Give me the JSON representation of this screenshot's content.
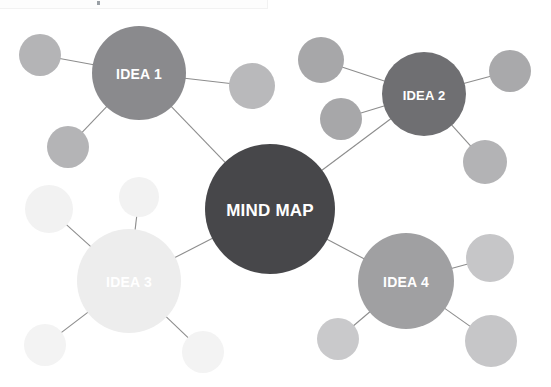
{
  "canvas": {
    "width": 551,
    "height": 387,
    "background": "#ffffff"
  },
  "top_strip": {
    "label": "toolbar-strip",
    "width": 268,
    "height": 9,
    "fill": "#fdfdfd",
    "border": "#f2f2f2",
    "dot_color": "#9aa0a6"
  },
  "diagram": {
    "title": "MIND MAP",
    "type": "mind-map",
    "link_color": "#8d8d8d",
    "link_width": 1.1,
    "main_nodes": [
      {
        "id": "center",
        "label": "MIND MAP",
        "cx": 270,
        "cy": 209,
        "r": 65,
        "fill": "#47474a",
        "text_fill": "#ffffff",
        "font_size": 17
      },
      {
        "id": "idea1",
        "label": "IDEA 1",
        "cx": 139,
        "cy": 73,
        "r": 47,
        "fill": "#8a8a8d",
        "text_fill": "#ffffff",
        "font_size": 14
      },
      {
        "id": "idea2",
        "label": "IDEA 2",
        "cx": 424,
        "cy": 94,
        "r": 42,
        "fill": "#6f6f72",
        "text_fill": "#ffffff",
        "font_size": 13
      },
      {
        "id": "idea3",
        "label": "IDEA 3",
        "cx": 129,
        "cy": 281,
        "r": 52,
        "fill": "#ededed",
        "text_fill": "#ffffff",
        "font_size": 14
      },
      {
        "id": "idea4",
        "label": "IDEA 4",
        "cx": 406,
        "cy": 281,
        "r": 48,
        "fill": "#a0a0a2",
        "text_fill": "#ffffff",
        "font_size": 14
      }
    ],
    "satellite_nodes": [
      {
        "id": "s1",
        "parent": "idea1",
        "cx": 40,
        "cy": 55,
        "r": 21,
        "fill": "#b4b4b6"
      },
      {
        "id": "s2",
        "parent": "idea1",
        "cx": 68,
        "cy": 147,
        "r": 21,
        "fill": "#b4b4b6"
      },
      {
        "id": "s3",
        "parent": "idea1",
        "cx": 252,
        "cy": 86,
        "r": 23,
        "fill": "#b9b9bb"
      },
      {
        "id": "s4",
        "parent": "idea2",
        "cx": 321,
        "cy": 60,
        "r": 23,
        "fill": "#a7a7a9"
      },
      {
        "id": "s5",
        "parent": "idea2",
        "cx": 341,
        "cy": 119,
        "r": 21,
        "fill": "#a7a7a9"
      },
      {
        "id": "s6",
        "parent": "idea2",
        "cx": 510,
        "cy": 71,
        "r": 21,
        "fill": "#a9a9ab"
      },
      {
        "id": "s7",
        "parent": "idea2",
        "cx": 485,
        "cy": 162,
        "r": 22,
        "fill": "#b3b3b5"
      },
      {
        "id": "s8",
        "parent": "idea3",
        "cx": 49,
        "cy": 209,
        "r": 24,
        "fill": "#f2f2f2"
      },
      {
        "id": "s9",
        "parent": "idea3",
        "cx": 139,
        "cy": 197,
        "r": 20,
        "fill": "#f2f2f2"
      },
      {
        "id": "s10",
        "parent": "idea3",
        "cx": 45,
        "cy": 345,
        "r": 21,
        "fill": "#f3f3f3"
      },
      {
        "id": "s11",
        "parent": "idea3",
        "cx": 203,
        "cy": 352,
        "r": 21,
        "fill": "#f3f3f3"
      },
      {
        "id": "s12",
        "parent": "idea4",
        "cx": 338,
        "cy": 339,
        "r": 21,
        "fill": "#c9c9cb"
      },
      {
        "id": "s13",
        "parent": "idea4",
        "cx": 490,
        "cy": 258,
        "r": 24,
        "fill": "#c6c6c8"
      },
      {
        "id": "s14",
        "parent": "idea4",
        "cx": 491,
        "cy": 341,
        "r": 26,
        "fill": "#c6c6c8"
      }
    ],
    "links": [
      {
        "from": "center",
        "to": "idea1"
      },
      {
        "from": "center",
        "to": "idea2"
      },
      {
        "from": "center",
        "to": "idea3"
      },
      {
        "from": "center",
        "to": "idea4"
      },
      {
        "from": "idea1",
        "to": "s1"
      },
      {
        "from": "idea1",
        "to": "s2"
      },
      {
        "from": "idea1",
        "to": "s3"
      },
      {
        "from": "idea2",
        "to": "s4"
      },
      {
        "from": "idea2",
        "to": "s5"
      },
      {
        "from": "idea2",
        "to": "s6"
      },
      {
        "from": "idea2",
        "to": "s7"
      },
      {
        "from": "idea3",
        "to": "s8"
      },
      {
        "from": "idea3",
        "to": "s9"
      },
      {
        "from": "idea3",
        "to": "s10"
      },
      {
        "from": "idea3",
        "to": "s11"
      },
      {
        "from": "idea4",
        "to": "s12"
      },
      {
        "from": "idea4",
        "to": "s13"
      },
      {
        "from": "idea4",
        "to": "s14"
      }
    ]
  }
}
